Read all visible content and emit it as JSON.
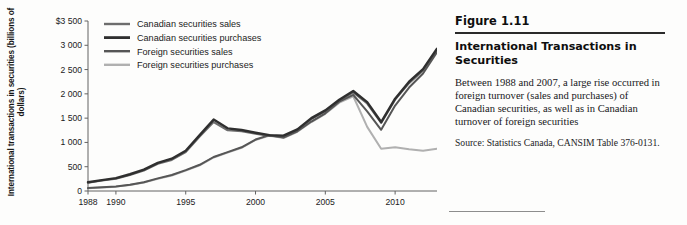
{
  "figure": {
    "number": "Figure 1.11",
    "title": "International Transactions in Securities",
    "body": "Between 1988 and 2007, a large rise occurred in foreign turnover (sales and purchases) of Canadian securities, as well as in Canadian turnover of foreign securities",
    "source": "Source: Statistics Canada, CANSIM Table 376-0131."
  },
  "chart_data": {
    "type": "line",
    "title": "",
    "xlabel": "",
    "ylabel": "International transactions in securities (billions of dollars)",
    "xlim": [
      1988,
      2013
    ],
    "ylim": [
      0,
      3500
    ],
    "grid": false,
    "legend_position": "top-left",
    "x": [
      1988,
      1989,
      1990,
      1991,
      1992,
      1993,
      1994,
      1995,
      1996,
      1997,
      1998,
      1999,
      2000,
      2001,
      2002,
      2003,
      2004,
      2005,
      2006,
      2007,
      2008,
      2009,
      2010,
      2011,
      2012,
      2013
    ],
    "ytick_labels": [
      "0",
      "500",
      "1 000",
      "1 500",
      "2 000",
      "2 500",
      "3 000",
      "$3 500"
    ],
    "yticks": [
      0,
      500,
      1000,
      1500,
      2000,
      2500,
      3000,
      3500
    ],
    "xtick_labels": [
      "1988",
      "1990",
      "1995",
      "2000",
      "2005",
      "2010"
    ],
    "xticks": [
      1988,
      1990,
      1995,
      2000,
      2005,
      2010
    ],
    "series": [
      {
        "name": "Canadian securities sales",
        "color": "#6d6d6d",
        "values": [
          170,
          215,
          250,
          330,
          420,
          560,
          640,
          800,
          1120,
          1420,
          1250,
          1230,
          1180,
          1130,
          1120,
          1250,
          1480,
          1640,
          1860,
          2030,
          1800,
          1400,
          1880,
          2220,
          2480,
          2900
        ]
      },
      {
        "name": "Canadian securities purchases",
        "color": "#2f2f2f",
        "values": [
          180,
          225,
          265,
          345,
          440,
          580,
          665,
          830,
          1150,
          1470,
          1290,
          1255,
          1200,
          1150,
          1140,
          1270,
          1500,
          1660,
          1880,
          2060,
          1830,
          1420,
          1900,
          2250,
          2510,
          2930
        ]
      },
      {
        "name": "Foreign securities sales",
        "color": "#565656",
        "values": [
          60,
          75,
          95,
          130,
          180,
          260,
          330,
          430,
          540,
          700,
          800,
          900,
          1060,
          1150,
          1100,
          1230,
          1430,
          1600,
          1840,
          1980,
          1640,
          1260,
          1760,
          2130,
          2420,
          2860
        ]
      },
      {
        "name": "Foreign securities purchases",
        "color": "#b0b0b0",
        "values": [
          55,
          70,
          90,
          125,
          175,
          250,
          320,
          420,
          530,
          690,
          790,
          890,
          1050,
          1140,
          1090,
          1220,
          1420,
          1590,
          1820,
          1950,
          1320,
          870,
          900,
          860,
          830,
          870
        ]
      }
    ]
  }
}
